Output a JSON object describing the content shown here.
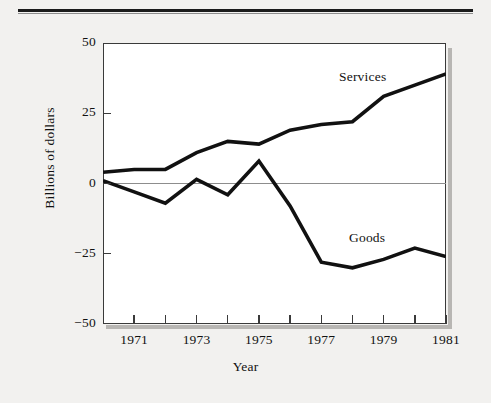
{
  "figure": {
    "y_axis_title": "Billions of dollars",
    "x_axis_title": "Year",
    "y_ticks": [
      "50",
      "25",
      "0",
      "-25",
      "-50"
    ],
    "x_ticks": [
      "1971",
      "1973",
      "1975",
      "1977",
      "1979",
      "1981"
    ],
    "annotations": {
      "services": "Services",
      "goods": "Goods"
    },
    "colors": {
      "line": "#111111",
      "frame": "#3a3a3a",
      "zero_line": "#8d8d8d",
      "page_background": "#f2f1ef",
      "plot_background": "#ffffff",
      "shadow": "#b8b6b3"
    }
  },
  "chart_data": {
    "type": "line",
    "title": "",
    "xlabel": "Year",
    "ylabel": "Billions of dollars",
    "xlim": [
      1970,
      1981
    ],
    "ylim": [
      -50,
      50
    ],
    "yticks": [
      50,
      25,
      0,
      -25,
      -50
    ],
    "xticks": [
      1971,
      1973,
      1975,
      1977,
      1979,
      1981
    ],
    "xticks_minor": [
      1970,
      1972,
      1974,
      1976,
      1978,
      1980
    ],
    "grid": false,
    "legend": "inline-annotations",
    "x": [
      1970,
      1971,
      1972,
      1973,
      1974,
      1975,
      1976,
      1977,
      1978,
      1979,
      1980,
      1981
    ],
    "series": [
      {
        "name": "Services",
        "values": [
          4,
          5,
          5,
          11,
          15,
          14,
          19,
          21,
          22,
          31,
          35,
          39
        ]
      },
      {
        "name": "Goods",
        "values": [
          1,
          -3,
          -7,
          1.5,
          -4,
          8,
          -8,
          -28,
          -30,
          -27,
          -23,
          -26
        ]
      }
    ]
  }
}
